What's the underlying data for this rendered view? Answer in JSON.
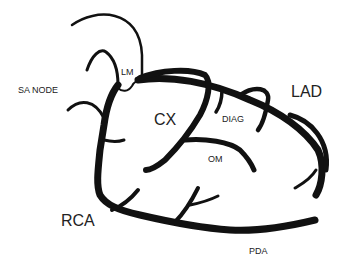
{
  "diagram": {
    "labels": {
      "sa_node": "SA NODE",
      "lm": "LM",
      "cx": "CX",
      "diag": "DIAG",
      "lad": "LAD",
      "om": "OM",
      "rca": "RCA",
      "pda": "PDA"
    },
    "colors": {
      "vessel": "#111111",
      "text": "#222222",
      "background": "#ffffff"
    }
  }
}
